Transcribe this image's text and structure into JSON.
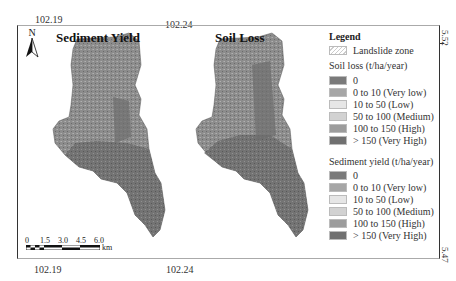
{
  "figure": {
    "top_ticks": [
      "102.19",
      "102.24"
    ],
    "bottom_ticks": [
      "102.19",
      "102.24"
    ],
    "right_ticks": [
      "5.52",
      "5.47"
    ],
    "north_arrow_label": "N",
    "maps": [
      {
        "title": "Sediment Yield"
      },
      {
        "title": "Soil Loss"
      }
    ],
    "scale_bar": {
      "labels": [
        "0",
        "1.5",
        "3.0",
        "4.5",
        "6.0"
      ],
      "unit": "km"
    }
  },
  "legend": {
    "title": "Legend",
    "landslide_label": "Landslide zone",
    "soil_loss": {
      "heading": "Soil loss (t/ha/year)",
      "classes": [
        {
          "label": "0",
          "color": "#7a7a7a"
        },
        {
          "label": "0 to 10 (Very low)",
          "color": "#a6a6a6"
        },
        {
          "label": "10 to 50 (Low)",
          "color": "#e6e6e6"
        },
        {
          "label": "50 to 100 (Medium)",
          "color": "#d2d2d2"
        },
        {
          "label": "100 to 150 (High)",
          "color": "#9c9c9c"
        },
        {
          "label": "> 150 (Very High)",
          "color": "#707070"
        }
      ]
    },
    "sediment_yield": {
      "heading": "Sediment yield (t/ha/year)",
      "classes": [
        {
          "label": "0",
          "color": "#7a7a7a"
        },
        {
          "label": "0 to 10 (Very low)",
          "color": "#a6a6a6"
        },
        {
          "label": "10 to 50 (Low)",
          "color": "#e6e6e6"
        },
        {
          "label": "50 to 100 (Medium)",
          "color": "#d2d2d2"
        },
        {
          "label": "100 to 150 (High)",
          "color": "#9c9c9c"
        },
        {
          "label": "> 150 (Very High)",
          "color": "#707070"
        }
      ]
    }
  }
}
